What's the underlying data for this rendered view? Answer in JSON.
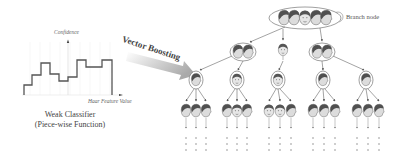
{
  "weak_classifier": {
    "y_axis_label": "Confidence",
    "x_axis_label": "Haar Feature Value",
    "caption_line1": "Weak Classifier",
    "caption_line2": "(Piece-wise Function)",
    "step_function": [
      {
        "x0": 24,
        "x1": 32,
        "y": 85
      },
      {
        "x0": 32,
        "x1": 41,
        "y": 75
      },
      {
        "x0": 41,
        "x1": 50,
        "y": 63
      },
      {
        "x0": 50,
        "x1": 59,
        "y": 74
      },
      {
        "x0": 59,
        "x1": 68,
        "y": 81
      },
      {
        "x0": 68,
        "x1": 77,
        "y": 77
      },
      {
        "x0": 77,
        "x1": 86,
        "y": 60
      },
      {
        "x0": 86,
        "x1": 102,
        "y": 67
      },
      {
        "x0": 102,
        "x1": 112,
        "y": 60
      }
    ]
  },
  "process_arrow": {
    "label": "Vector Boosting"
  },
  "legend": {
    "label": "Branch node"
  },
  "tree": {
    "root": {
      "faces": 5
    },
    "level2": [
      {
        "faces": 2,
        "branch": true
      },
      {
        "faces": 1,
        "branch": false
      },
      {
        "faces": 2,
        "branch": true
      }
    ],
    "level3": [
      {
        "faces": 1
      },
      {
        "faces": 1
      },
      {
        "faces": 1
      },
      {
        "faces": 1
      },
      {
        "faces": 1
      }
    ],
    "level4_children_per_node": 3,
    "continuation": "..."
  },
  "colors": {
    "line": "#555555",
    "face_dark": "#5a5a5a",
    "face_light": "#cfcfcf",
    "arrow_gradient_start": "#ffffff",
    "arrow_gradient_end": "#9a9a9a"
  }
}
